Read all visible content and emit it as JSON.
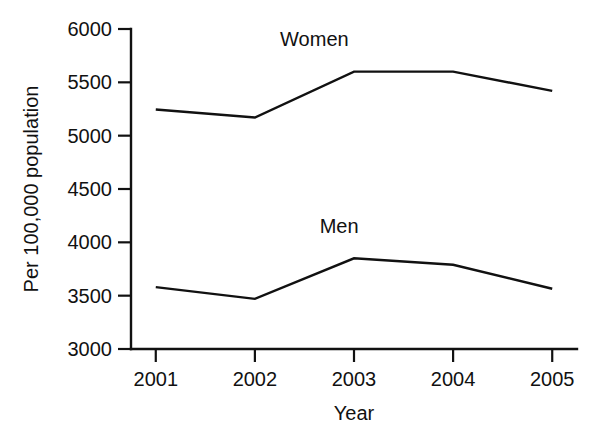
{
  "chart_data": {
    "type": "line",
    "title": "",
    "xlabel": "Year",
    "ylabel": "Per 100,000 population",
    "categories": [
      "2001",
      "2002",
      "2003",
      "2004",
      "2005"
    ],
    "x": [
      2001,
      2002,
      2003,
      2004,
      2005
    ],
    "xlim": [
      2000.75,
      2005.25
    ],
    "ylim": [
      3000,
      6000
    ],
    "yticks": [
      "3000",
      "3500",
      "4000",
      "4500",
      "5000",
      "5500",
      "6000"
    ],
    "ytick_values": [
      3000,
      3500,
      4000,
      4500,
      5000,
      5500,
      6000
    ],
    "grid": false,
    "legend_position": "inline-annotations",
    "line_color": "#111111",
    "background_color": "#ffffff",
    "series": [
      {
        "name": "Women",
        "values": [
          5245,
          5170,
          5600,
          5600,
          5420
        ],
        "label_x": 2002.6,
        "label_y": 5840
      },
      {
        "name": "Men",
        "values": [
          3580,
          3470,
          3850,
          3790,
          3565
        ],
        "label_x": 2002.85,
        "label_y": 4090
      }
    ]
  }
}
